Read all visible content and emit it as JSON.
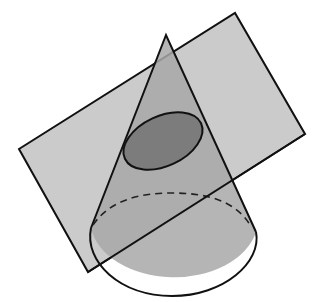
{
  "diagram": {
    "colors": {
      "background": "#ffffff",
      "plane_fill": "#c9c9c9",
      "cone_fill": "#a9a9a9",
      "ellipse_fill": "#7a7a7a",
      "stroke": "#111111"
    },
    "plane": {
      "points": "19,149 235,13 305,134 88,272"
    },
    "cone": {
      "apex": [
        166,
        35
      ],
      "base_center": [
        172,
        238
      ],
      "base_rx": 84,
      "base_ry": 58
    },
    "section_ellipse": {
      "cx": 163,
      "cy": 141,
      "rx": 42,
      "ry": 25,
      "rotate": -25
    }
  }
}
